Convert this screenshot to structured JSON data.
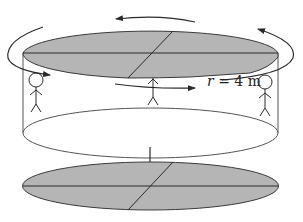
{
  "diagram": {
    "radius_label": {
      "variable": "r",
      "equals": " = 4 m"
    },
    "figures": [
      {
        "id": "person-left",
        "position": "left wall"
      },
      {
        "id": "person-center",
        "position": "front center"
      },
      {
        "id": "person-right",
        "position": "right wall"
      }
    ],
    "rotation_arrows": [
      "top-back",
      "left-side",
      "front",
      "right-side"
    ],
    "colors": {
      "disk_fill": "#b5b5b5",
      "stroke": "#3a3a3a",
      "background": "#ffffff"
    }
  }
}
